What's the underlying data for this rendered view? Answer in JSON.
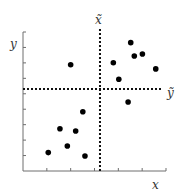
{
  "chart_data": {
    "type": "scatter",
    "title": "",
    "xlabel": "x",
    "ylabel": "y",
    "xlim": [
      0,
      6
    ],
    "ylim": [
      0,
      9
    ],
    "x_ticks": [
      0,
      1,
      2,
      3,
      4,
      5,
      6
    ],
    "y_ticks": [
      0,
      1,
      2,
      3,
      4,
      5,
      6,
      7,
      8,
      9
    ],
    "tick_labels_shown": false,
    "grid": false,
    "rotated_axes": {
      "x_tilde": {
        "label": "x̃",
        "direction": "vertical",
        "at_x": 3.23
      },
      "y_tilde": {
        "label": "ỹ",
        "direction": "horizontal",
        "at_y": 5.31
      }
    },
    "points": [
      {
        "x": 4.52,
        "y": 8.31
      },
      {
        "x": 4.67,
        "y": 7.45
      },
      {
        "x": 5.01,
        "y": 7.58
      },
      {
        "x": 3.79,
        "y": 7.01
      },
      {
        "x": 5.57,
        "y": 6.61
      },
      {
        "x": 4.02,
        "y": 5.94
      },
      {
        "x": 2.0,
        "y": 6.88
      },
      {
        "x": 4.41,
        "y": 4.47
      },
      {
        "x": 2.51,
        "y": 3.84
      },
      {
        "x": 1.55,
        "y": 2.74
      },
      {
        "x": 2.21,
        "y": 2.59
      },
      {
        "x": 1.86,
        "y": 1.62
      },
      {
        "x": 1.06,
        "y": 1.19
      },
      {
        "x": 2.6,
        "y": 0.97
      }
    ],
    "colors": {
      "points": "#000000",
      "axes": "#6e6e6e",
      "dashed": "#111111"
    }
  }
}
